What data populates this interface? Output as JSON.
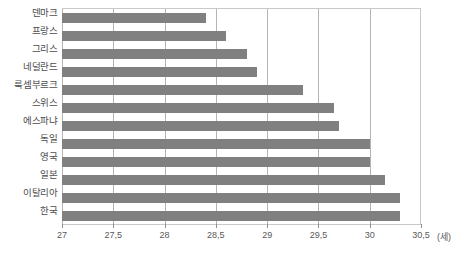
{
  "chart_data": {
    "type": "bar",
    "orientation": "horizontal",
    "title": "",
    "xlabel": "(세)",
    "ylabel": "",
    "unit": "(세)",
    "xlim": [
      27,
      30.5
    ],
    "grid": true,
    "legend": false,
    "xticks": [
      "27",
      "27,5",
      "28",
      "28,5",
      "29",
      "29,5",
      "30",
      "30,5"
    ],
    "xtick_values": [
      27,
      27.5,
      28,
      28.5,
      29,
      29.5,
      30,
      30.5
    ],
    "categories": [
      "덴마크",
      "프랑스",
      "그리스",
      "네덜란드",
      "룩셈부르크",
      "스위스",
      "에스파냐",
      "독일",
      "영국",
      "일본",
      "이탈리아",
      "한국"
    ],
    "values": [
      28.4,
      28.6,
      28.8,
      28.9,
      29.35,
      29.65,
      29.7,
      30.0,
      30.0,
      30.15,
      30.3,
      30.3
    ],
    "series": [
      {
        "name": "",
        "color": "#808080",
        "values": [
          28.4,
          28.6,
          28.8,
          28.9,
          29.35,
          29.65,
          29.7,
          30.0,
          30.0,
          30.15,
          30.3,
          30.3
        ]
      }
    ]
  },
  "colors": {
    "bar": "#808080",
    "gridline": "#b5b5b5",
    "axis": "#c9c9c9",
    "text": "#595959",
    "background": "#ffffff"
  }
}
